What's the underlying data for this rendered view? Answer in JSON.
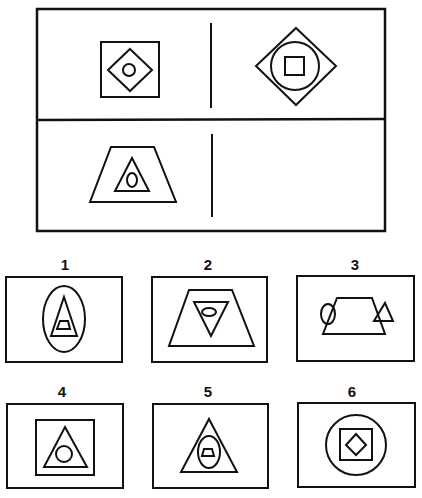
{
  "puzzle": {
    "type": "analogy matrix",
    "matrix": {
      "top_left": "square containing diamond containing circle",
      "top_right": "diamond containing circle containing square",
      "bottom_left": "trapezoid containing triangle containing oval",
      "bottom_right": "empty"
    },
    "options": [
      {
        "label": "1",
        "description": "oval containing triangle containing trapezoid"
      },
      {
        "label": "2",
        "description": "trapezoid containing inverted triangle containing oval"
      },
      {
        "label": "3",
        "description": "trapezoid with oval and triangle overlapping its sides"
      },
      {
        "label": "4",
        "description": "square containing triangle containing circle"
      },
      {
        "label": "5",
        "description": "triangle containing oval containing trapezoid"
      },
      {
        "label": "6",
        "description": "circle containing square containing diamond"
      }
    ]
  },
  "colors": {
    "stroke": "#111111",
    "background": "#ffffff"
  }
}
